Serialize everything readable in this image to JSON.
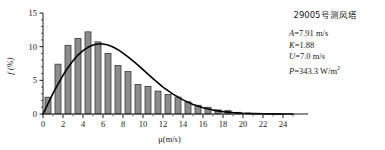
{
  "annotation": {
    "title": "29005号测风塔",
    "lines": [
      {
        "symbol": "A",
        "rest": "=7.91 m/s"
      },
      {
        "symbol": "K",
        "rest": "=1.88"
      },
      {
        "symbol": "U",
        "rest": "=7.0 m/s"
      },
      {
        "symbol": "P",
        "rest": "=343.3 W/m",
        "sup": "2"
      }
    ]
  },
  "chart_data": {
    "type": "bar",
    "title": "29005号测风塔",
    "xlabel": "μ(m/s)",
    "ylabel": "f (%)",
    "xlim": [
      0,
      25.3
    ],
    "ylim": [
      0,
      15
    ],
    "grid": false,
    "legend": null,
    "x_ticks": [
      0,
      2,
      4,
      6,
      8,
      10,
      12,
      14,
      16,
      18,
      20,
      22,
      24
    ],
    "x_minor_tick_step": 1,
    "y_ticks": [
      0,
      5,
      10,
      15
    ],
    "bar_color": "#8c8c8c",
    "bar_edge_color": "#3a3a3a",
    "curve_color": "#000000",
    "bin_centers": [
      0.5,
      1.5,
      2.5,
      3.5,
      4.5,
      5.5,
      6.5,
      7.5,
      8.5,
      9.5,
      10.5,
      11.5,
      12.5,
      13.5,
      14.5,
      15.5,
      16.5,
      17.5,
      18.5,
      19.5,
      20.5,
      21.5,
      22.5,
      23.5
    ],
    "values": [
      2.5,
      7.4,
      10.2,
      11.2,
      12.2,
      10.7,
      9.0,
      7.2,
      6.3,
      4.4,
      4.1,
      3.4,
      2.9,
      2.5,
      1.8,
      1.3,
      1.0,
      0.6,
      0.5,
      0.25,
      0.15,
      0.1,
      0.05,
      0.03
    ],
    "series": [
      {
        "name": "Weibull fit",
        "type": "line",
        "A": 7.91,
        "K": 1.88,
        "U_mean": 7.0,
        "P_density": 343.3,
        "x": [
          0,
          0.5,
          1,
          1.5,
          2,
          2.5,
          3,
          3.5,
          4,
          4.5,
          5,
          5.5,
          6,
          6.5,
          7,
          7.5,
          8,
          8.5,
          9,
          9.5,
          10,
          11,
          12,
          13,
          14,
          15,
          16,
          17,
          18,
          19,
          20,
          21,
          22,
          23,
          24,
          25
        ],
        "y": [
          0,
          1.55,
          3.05,
          4.45,
          5.75,
          6.9,
          7.9,
          8.75,
          9.4,
          9.9,
          10.25,
          10.4,
          10.4,
          10.25,
          9.95,
          9.55,
          9.05,
          8.5,
          7.9,
          7.25,
          6.6,
          5.25,
          4.0,
          2.95,
          2.1,
          1.4,
          0.92,
          0.58,
          0.35,
          0.2,
          0.11,
          0.06,
          0.03,
          0.015,
          0.007,
          0.003
        ]
      }
    ]
  }
}
